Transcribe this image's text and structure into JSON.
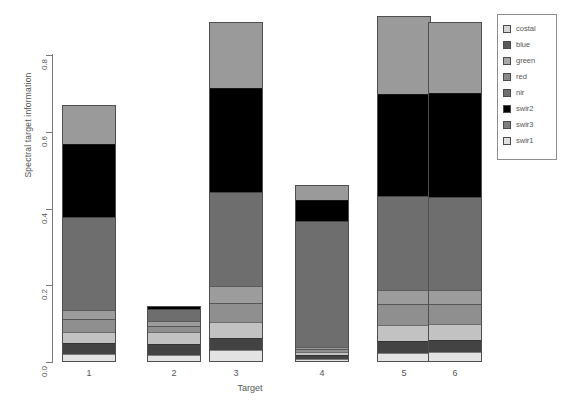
{
  "chart_data": {
    "type": "bar",
    "subtype": "stacked",
    "title": "",
    "xlabel": "Target",
    "ylabel": "Spectral target information",
    "categories": [
      "1",
      "2",
      "3",
      "4",
      "5",
      "6"
    ],
    "ylim": [
      0.0,
      0.9
    ],
    "yticks": [
      0.0,
      0.2,
      0.4,
      0.6,
      0.8
    ],
    "ytick_labels": [
      "0.0",
      "0.2",
      "0.4",
      "0.6",
      "0.8"
    ],
    "grid": false,
    "legend_position": "right",
    "legend_entries": [
      "costal",
      "blue",
      "green",
      "red",
      "nir",
      "swir2",
      "swir3",
      "swir1"
    ],
    "series": [
      {
        "name": "swir1",
        "color": "#e3e3e3",
        "values": [
          0.021,
          0.018,
          0.03,
          0.009,
          0.024,
          0.025
        ]
      },
      {
        "name": "swir3",
        "color": "#434343",
        "values": [
          0.028,
          0.03,
          0.032,
          0.008,
          0.03,
          0.032
        ]
      },
      {
        "name": "swir2",
        "color": "#000000",
        "values": [
          0.0,
          0.0,
          0.0,
          0.0,
          0.0,
          0.0
        ]
      },
      {
        "name": "nir",
        "color": "#c2c2c2",
        "values": [
          0.03,
          0.03,
          0.041,
          0.01,
          0.043,
          0.043
        ]
      },
      {
        "name": "red",
        "color": "#8f8f8f",
        "values": [
          0.034,
          0.016,
          0.052,
          0.006,
          0.053,
          0.05
        ]
      },
      {
        "name": "green",
        "color": "#9c9c9c",
        "values": [
          0.023,
          0.012,
          0.042,
          0.005,
          0.038,
          0.038
        ]
      },
      {
        "name": "nir2",
        "color": "#6e6e6e",
        "values": [
          0.243,
          0.031,
          0.247,
          0.33,
          0.245,
          0.243
        ]
      },
      {
        "name": "blue",
        "color": "#000000",
        "values": [
          0.19,
          0.009,
          0.27,
          0.055,
          0.265,
          0.27
        ]
      },
      {
        "name": "costal",
        "color": "#9a9a9a",
        "values": [
          0.102,
          0.0,
          0.173,
          0.039,
          0.204,
          0.185
        ]
      }
    ],
    "bar_totals": [
      0.671,
      0.146,
      0.887,
      0.462,
      0.902,
      0.886
    ],
    "stack_order_bottom_to_top": [
      "swir1",
      "swir3",
      "nir",
      "red",
      "green",
      "nir2",
      "blue",
      "costal"
    ]
  },
  "legend": {
    "items": [
      {
        "label": "costal",
        "color": "#d6d6d6"
      },
      {
        "label": "blue",
        "color": "#5a5a5a"
      },
      {
        "label": "green",
        "color": "#a8a8a8"
      },
      {
        "label": "red",
        "color": "#8a8a8a"
      },
      {
        "label": "nir",
        "color": "#6e6e6e"
      },
      {
        "label": "swir2",
        "color": "#000000"
      },
      {
        "label": "swir3",
        "color": "#7d7d7d"
      },
      {
        "label": "swir1",
        "color": "#e0e0e0"
      }
    ]
  }
}
